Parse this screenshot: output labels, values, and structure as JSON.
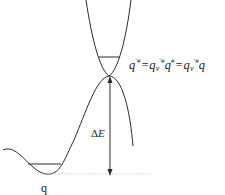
{
  "diagram": {
    "type": "potential-energy-surface",
    "stroke_color": "#2a2a2a",
    "labels": {
      "formula_q": "q",
      "formula_sup1": "'#",
      "formula_eq1": "=q",
      "formula_sub1": "v",
      "formula_sup2": "'#",
      "formula_q2": "q",
      "formula_sup3": "#",
      "formula_eq2": "=q",
      "formula_sub2": "v",
      "formula_sup4": "'#",
      "formula_tail": "q",
      "delta": "Δ",
      "energy": "E",
      "reactant": "q"
    }
  }
}
